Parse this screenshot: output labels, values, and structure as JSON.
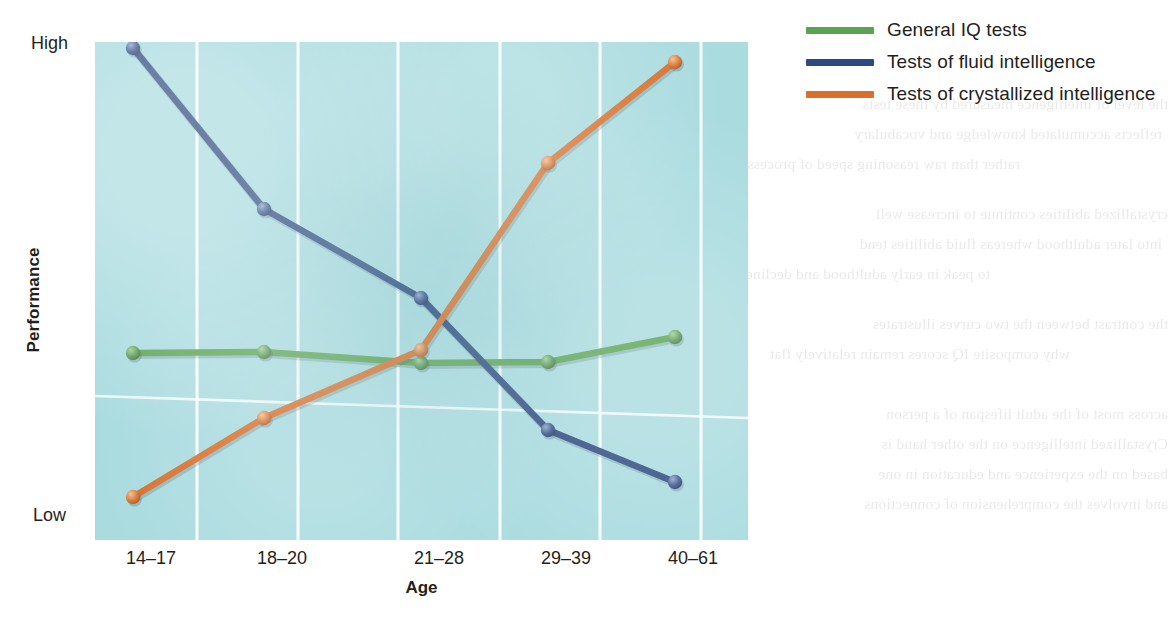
{
  "figure": {
    "y_axis_title": "Performance",
    "x_axis_title": "Age",
    "y_high_label": "High",
    "y_low_label": "Low"
  },
  "legend": {
    "items": [
      {
        "label": "General IQ tests",
        "color": "#5aa352",
        "key": "general-iq"
      },
      {
        "label": "Tests of fluid intelligence",
        "color": "#2d4a80",
        "key": "fluid"
      },
      {
        "label": "Tests of crystallized intelligence",
        "color": "#d8702c",
        "key": "crystallized"
      }
    ]
  },
  "colors": {
    "panel_background": "#a9dbdf",
    "gridline": "#ffffff",
    "text": "#231f20",
    "green": "#5aa352",
    "blue": "#2d4a80",
    "orange": "#d8702c"
  },
  "chart_data": {
    "type": "line",
    "title": "",
    "xlabel": "Age",
    "ylabel": "Performance",
    "categories": [
      "14–17",
      "18–20",
      "21–28",
      "29–39",
      "40–61"
    ],
    "ytick_labels": [
      "Low",
      "High"
    ],
    "ylim": [
      0,
      100
    ],
    "grid": "vertical gridlines plus one faint horizontal gridline",
    "legend_position": "top-right outside plot",
    "series": [
      {
        "name": "General IQ tests",
        "color": "#5aa352",
        "values": [
          43,
          43,
          40,
          40,
          45
        ],
        "x_positions": [
          133,
          264,
          421,
          548,
          675
        ],
        "y_positions": [
          353,
          352,
          363,
          362,
          337
        ]
      },
      {
        "name": "Tests of fluid intelligence",
        "color": "#2d4a80",
        "values": [
          99,
          68,
          50,
          22,
          12
        ],
        "x_positions": [
          133,
          264,
          421,
          548,
          675
        ],
        "y_positions": [
          48,
          209,
          298,
          430,
          482
        ]
      },
      {
        "name": "Tests of crystallized intelligence",
        "color": "#d8702c",
        "values": [
          9,
          25,
          39,
          76,
          96
        ],
        "x_positions": [
          133,
          264,
          421,
          548,
          675
        ],
        "y_positions": [
          497,
          418,
          350,
          163,
          62
        ]
      }
    ]
  },
  "background_text": {
    "lines": [
      "the level of intelligence measured by these tests",
      "reflects accumulated knowledge and vocabulary",
      "rather than raw reasoning speed of processing",
      "crystallized abilities continue to increase well",
      "into later adulthood whereas fluid abilities tend",
      "to peak in early adulthood and decline steadily",
      "the contrast between the two curves illustrates",
      "why composite IQ scores remain relatively flat",
      "across most of the adult lifespan of a person",
      "Crystallized intelligence on the other hand is",
      "based on the experience and education in one",
      "and involves the comprehension of connections"
    ]
  }
}
